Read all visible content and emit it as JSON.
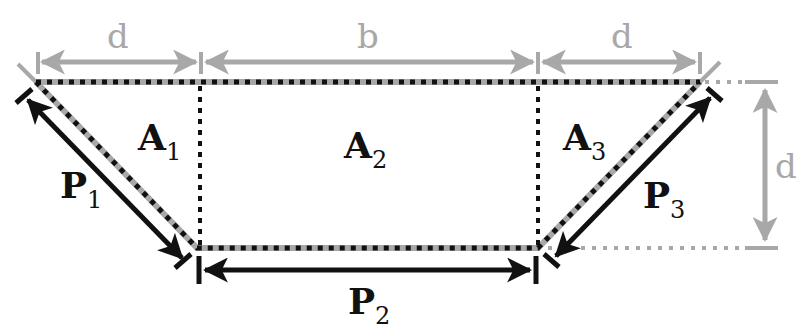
{
  "colors": {
    "gray": "#a8a8a8",
    "black": "#111111",
    "background": "#ffffff"
  },
  "dimensions": {
    "top_left": "d",
    "top_middle": "b",
    "top_right": "d",
    "right_vertical": "d"
  },
  "areas": [
    {
      "base": "A",
      "sub": "1"
    },
    {
      "base": "A",
      "sub": "2"
    },
    {
      "base": "A",
      "sub": "3"
    }
  ],
  "perimeters": [
    {
      "base": "P",
      "sub": "1"
    },
    {
      "base": "P",
      "sub": "2"
    },
    {
      "base": "P",
      "sub": "3"
    }
  ]
}
